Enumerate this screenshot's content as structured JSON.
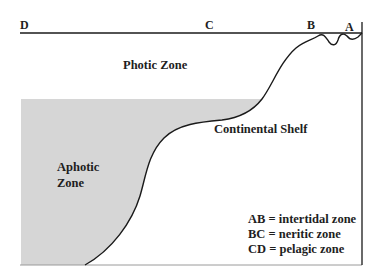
{
  "diagram": {
    "type": "ocean-zones-cross-section",
    "points": [
      {
        "id": "D",
        "label": "D"
      },
      {
        "id": "C",
        "label": "C"
      },
      {
        "id": "B",
        "label": "B"
      },
      {
        "id": "A",
        "label": "A"
      }
    ],
    "regions": {
      "photic": {
        "label": "Photic Zone"
      },
      "aphotic": {
        "line1": "Aphotic",
        "line2": "Zone",
        "fill": "#d6d6d6"
      },
      "shelf": {
        "label": "Continental Shelf"
      }
    },
    "legend": [
      {
        "text": "AB = intertidal zone"
      },
      {
        "text": "BC = neritic zone"
      },
      {
        "text": "CD = pelagic zone"
      }
    ],
    "colors": {
      "line": "#1a1a1a",
      "aphotic_fill": "#d6d6d6",
      "background": "#ffffff"
    }
  }
}
